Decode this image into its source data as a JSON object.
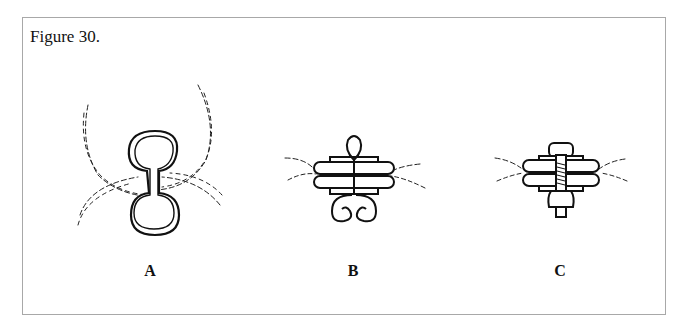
{
  "figure": {
    "title": "Figure 30.",
    "panels": [
      {
        "id": "A",
        "label": "A",
        "description": "dumbbell-shaped ring between hair tufts"
      },
      {
        "id": "B",
        "label": "B",
        "description": "wire loop closure with spiral coils through two bars"
      },
      {
        "id": "C",
        "label": "C",
        "description": "threaded bolt and nut through two bars"
      }
    ]
  }
}
